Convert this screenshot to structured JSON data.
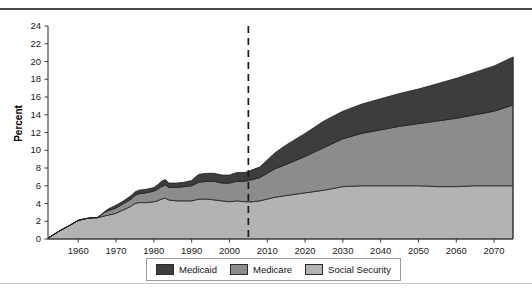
{
  "chart_data": {
    "type": "area",
    "stacked": true,
    "title": "",
    "xlabel": "",
    "ylabel": "Percent",
    "xlim": [
      1952,
      2075
    ],
    "ylim": [
      0,
      24
    ],
    "ytick_step": 2,
    "grid": false,
    "legend_position": "bottom-center",
    "ytick_labels": [
      "0",
      "2",
      "4",
      "6",
      "8",
      "10",
      "12",
      "14",
      "16",
      "18",
      "20",
      "22",
      "24"
    ],
    "xtick_labels": [
      "1960",
      "1970",
      "1980",
      "1990",
      "2000",
      "2010",
      "2020",
      "2030",
      "2040",
      "2050",
      "2060",
      "2070"
    ],
    "xticks": [
      1960,
      1970,
      1980,
      1990,
      2000,
      2010,
      2020,
      2030,
      2040,
      2050,
      2060,
      2070
    ],
    "annotations": [
      {
        "type": "vline",
        "x": 2005,
        "style": "dashed",
        "label": ""
      }
    ],
    "x": [
      1952,
      1955,
      1958,
      1960,
      1962,
      1964,
      1965,
      1966,
      1967,
      1968,
      1970,
      1972,
      1974,
      1975,
      1976,
      1978,
      1980,
      1981,
      1982,
      1983,
      1984,
      1986,
      1988,
      1990,
      1991,
      1992,
      1994,
      1996,
      1998,
      2000,
      2002,
      2004,
      2005,
      2006,
      2008,
      2010,
      2012,
      2015,
      2020,
      2025,
      2030,
      2035,
      2040,
      2045,
      2050,
      2055,
      2060,
      2065,
      2070,
      2075
    ],
    "series": [
      {
        "name": "Social Security",
        "color": "#b3b3b3",
        "values": [
          0.1,
          0.9,
          1.6,
          2.1,
          2.3,
          2.4,
          2.4,
          2.5,
          2.6,
          2.7,
          2.9,
          3.3,
          3.7,
          4.0,
          4.1,
          4.1,
          4.2,
          4.3,
          4.5,
          4.6,
          4.4,
          4.3,
          4.3,
          4.3,
          4.4,
          4.5,
          4.5,
          4.4,
          4.3,
          4.2,
          4.3,
          4.2,
          4.2,
          4.2,
          4.3,
          4.5,
          4.7,
          4.9,
          5.2,
          5.5,
          5.9,
          6.0,
          6.0,
          6.0,
          6.0,
          5.9,
          5.9,
          6.0,
          6.0,
          6.0
        ]
      },
      {
        "name": "Medicare",
        "color": "#8c8c8c",
        "values": [
          0.0,
          0.0,
          0.0,
          0.0,
          0.0,
          0.0,
          0.0,
          0.2,
          0.4,
          0.5,
          0.6,
          0.7,
          0.8,
          0.9,
          1.0,
          1.1,
          1.2,
          1.3,
          1.4,
          1.5,
          1.4,
          1.5,
          1.6,
          1.7,
          1.8,
          1.9,
          2.0,
          2.1,
          2.0,
          2.1,
          2.2,
          2.3,
          2.4,
          2.5,
          2.6,
          2.9,
          3.2,
          3.5,
          4.1,
          4.8,
          5.4,
          5.9,
          6.3,
          6.7,
          7.0,
          7.4,
          7.7,
          8.0,
          8.4,
          9.1
        ]
      },
      {
        "name": "Medicaid",
        "color": "#3d3d3d",
        "values": [
          0.0,
          0.0,
          0.0,
          0.0,
          0.0,
          0.0,
          0.0,
          0.0,
          0.1,
          0.2,
          0.3,
          0.3,
          0.4,
          0.4,
          0.4,
          0.4,
          0.4,
          0.5,
          0.6,
          0.6,
          0.5,
          0.5,
          0.5,
          0.6,
          0.8,
          0.9,
          0.9,
          0.9,
          0.9,
          0.9,
          1.0,
          1.0,
          1.0,
          1.1,
          1.2,
          1.5,
          1.8,
          2.2,
          2.6,
          3.0,
          3.1,
          3.3,
          3.5,
          3.7,
          3.9,
          4.2,
          4.5,
          4.8,
          5.1,
          5.4
        ]
      }
    ]
  },
  "legend": {
    "items": [
      {
        "label": "Medicaid",
        "color": "#3d3d3d"
      },
      {
        "label": "Medicare",
        "color": "#8c8c8c"
      },
      {
        "label": "Social Security",
        "color": "#b3b3b3"
      }
    ]
  }
}
